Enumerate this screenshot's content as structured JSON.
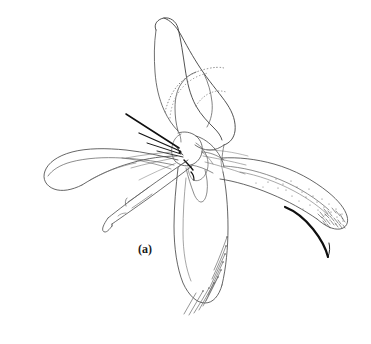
{
  "figure": {
    "panel_label": "(a)",
    "caption_visible": false,
    "background_color": "#ffffff",
    "ink_color": "#3a3a3a",
    "dark_ink_color": "#111111",
    "light_ink_color": "#6e6e6e",
    "canvas": {
      "width": 371,
      "height": 344
    },
    "parts": [
      {
        "name": "dorsal-lobe",
        "position": "upper-center",
        "style": "outline-with-stippled-inner-margin"
      },
      {
        "name": "left-lateral-lobe",
        "position": "left",
        "style": "curved-outline-rounded-tip"
      },
      {
        "name": "right-lateral-lobe",
        "position": "right",
        "style": "tapering-outline-with-stippling-and-apical-spinules"
      },
      {
        "name": "ventral-lobe",
        "position": "lower-center",
        "style": "outline-with-marginal-setae"
      },
      {
        "name": "aedeagus-needle",
        "position": "lower-left",
        "style": "narrow-elongate-with-pointed-barbed-apex"
      },
      {
        "name": "central-junction",
        "position": "center",
        "style": "overlapping-sclerite-plates-with-dark-spines"
      },
      {
        "name": "apical-bristle",
        "position": "right",
        "style": "thick-dark-curved-seta"
      }
    ]
  }
}
